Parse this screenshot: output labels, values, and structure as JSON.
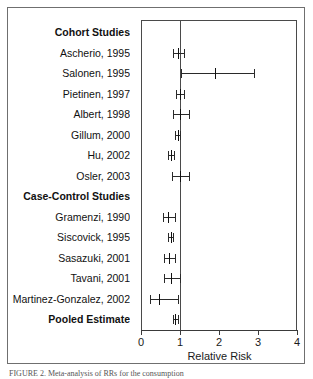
{
  "figure": {
    "caption": "FIGURE 2. Meta-analysis of RRs for the consumption",
    "xaxis_title": "Relative Risk"
  },
  "chart_data": {
    "type": "forest",
    "title": "",
    "xlabel": "Relative Risk",
    "ylabel": "",
    "xlim": [
      0,
      4
    ],
    "xticks": [
      0,
      1,
      2,
      3,
      4
    ],
    "xtick_labels": [
      "0",
      "1",
      "2",
      "3",
      "4"
    ],
    "null_line": 1,
    "grid": false,
    "legend": "none",
    "rows": [
      {
        "label": "Cohort Studies",
        "type": "heading",
        "rr": null,
        "lower": null,
        "upper": null
      },
      {
        "label": "Ascherio, 1995",
        "type": "study",
        "rr": 0.95,
        "lower": 0.83,
        "upper": 1.1
      },
      {
        "label": "Salonen, 1995",
        "type": "study",
        "rr": 1.9,
        "lower": 1.03,
        "upper": 2.9
      },
      {
        "label": "Pietinen, 1997",
        "type": "study",
        "rr": 0.99,
        "lower": 0.9,
        "upper": 1.09
      },
      {
        "label": "Albert, 1998",
        "type": "study",
        "rr": 1.0,
        "lower": 0.83,
        "upper": 1.24
      },
      {
        "label": "Gillum, 2000",
        "type": "study",
        "rr": 0.95,
        "lower": 0.88,
        "upper": 1.01
      },
      {
        "label": "Hu, 2002",
        "type": "study",
        "rr": 0.76,
        "lower": 0.68,
        "upper": 0.85
      },
      {
        "label": "Osler, 2003",
        "type": "study",
        "rr": 1.0,
        "lower": 0.79,
        "upper": 1.24
      },
      {
        "label": "Case-Control Studies",
        "type": "heading",
        "rr": null,
        "lower": null,
        "upper": null
      },
      {
        "label": "Gramenzi, 1990",
        "type": "study",
        "rr": 0.7,
        "lower": 0.57,
        "upper": 0.87
      },
      {
        "label": "Siscovick, 1995",
        "type": "study",
        "rr": 0.76,
        "lower": 0.7,
        "upper": 0.83
      },
      {
        "label": "Sasazuki, 2001",
        "type": "study",
        "rr": 0.72,
        "lower": 0.58,
        "upper": 0.88
      },
      {
        "label": "Tavani, 2001",
        "type": "study",
        "rr": 0.78,
        "lower": 0.6,
        "upper": 1.0
      },
      {
        "label": "Martinez-Gonzalez, 2002",
        "type": "study",
        "rr": 0.46,
        "lower": 0.23,
        "upper": 0.95
      },
      {
        "label": "Pooled Estimate",
        "type": "pooled",
        "rr": 0.88,
        "lower": 0.82,
        "upper": 0.94
      }
    ]
  }
}
